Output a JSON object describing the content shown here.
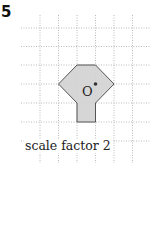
{
  "question": {
    "number": "5",
    "caption": "scale factor 2",
    "center_label": "O"
  },
  "grid": {
    "x_lines": [
      40,
      58.5,
      77,
      95.5,
      114,
      132.5
    ],
    "y_lines": [
      28,
      46.5,
      65,
      84,
      103,
      122,
      141
    ],
    "x_extent": [
      21,
      150
    ],
    "y_extent": [
      15,
      163
    ],
    "line_color": "#a8a8a8"
  },
  "shape": {
    "vertices": [
      [
        77,
        65
      ],
      [
        95.5,
        65
      ],
      [
        114,
        84
      ],
      [
        95.5,
        103
      ],
      [
        95.5,
        122
      ],
      [
        77,
        122
      ],
      [
        77,
        103
      ],
      [
        58.5,
        84
      ]
    ],
    "fill": "#d2d2d2",
    "stroke": "#555555"
  },
  "center_point": {
    "x": 95.5,
    "y": 84,
    "color": "#333333"
  }
}
